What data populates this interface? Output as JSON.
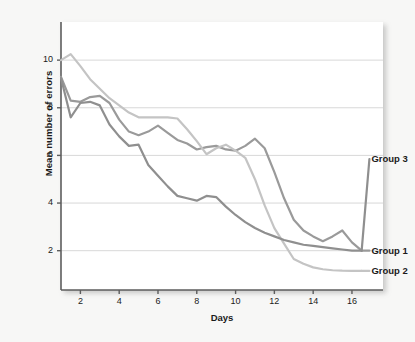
{
  "chart_data": {
    "type": "line",
    "title": "",
    "xlabel": "Days",
    "ylabel": "Mean number of errors",
    "xlim": [
      1,
      17.6
    ],
    "ylim": [
      0.35,
      11.6
    ],
    "grid": "horizontal",
    "legend_position": "right-inline",
    "xticks": [
      2,
      4,
      6,
      8,
      10,
      12,
      14,
      16
    ],
    "yticks": [
      2,
      4,
      6,
      8,
      10
    ],
    "x": [
      1,
      1.5,
      2,
      2.5,
      3,
      3.5,
      4,
      4.5,
      5,
      5.5,
      6,
      6.5,
      7,
      7.5,
      8,
      8.5,
      9,
      9.5,
      10,
      10.5,
      11,
      11.5,
      12,
      12.5,
      13,
      13.5,
      14,
      14.5,
      15,
      15.5,
      16,
      16.5
    ],
    "series": [
      {
        "name": "Group 1",
        "color": "#9a9a9a",
        "label": "Group 1",
        "values": [
          9.3,
          8.3,
          8.25,
          8.45,
          8.5,
          8.2,
          7.5,
          7.0,
          6.85,
          7.0,
          7.25,
          6.95,
          6.65,
          6.5,
          6.25,
          6.35,
          6.4,
          6.25,
          6.2,
          6.4,
          6.7,
          6.3,
          5.3,
          4.2,
          3.3,
          2.85,
          2.6,
          2.4,
          2.6,
          2.85,
          2.35,
          2.0
        ]
      },
      {
        "name": "Group 2",
        "color": "#c4c4c4",
        "label": "Group 2",
        "values": [
          10.0,
          10.25,
          9.75,
          9.2,
          8.8,
          8.4,
          8.1,
          7.8,
          7.6,
          7.6,
          7.6,
          7.6,
          7.55,
          7.1,
          6.6,
          6.05,
          6.3,
          6.45,
          6.2,
          5.9,
          5.0,
          3.9,
          2.95,
          2.3,
          1.65,
          1.45,
          1.3,
          1.22,
          1.18,
          1.16,
          1.15,
          1.15
        ]
      },
      {
        "name": "Group 3",
        "color": "#8f8f8f",
        "label": "Group 3",
        "values": [
          9.25,
          7.6,
          8.2,
          8.25,
          8.1,
          7.3,
          6.8,
          6.4,
          6.45,
          5.6,
          5.15,
          4.7,
          4.3,
          4.2,
          4.1,
          4.3,
          4.25,
          3.85,
          3.5,
          3.2,
          2.95,
          2.75,
          2.6,
          2.45,
          2.35,
          2.25,
          2.2,
          2.15,
          2.1,
          2.05,
          2.0,
          2.0
        ]
      }
    ],
    "annotations": [
      {
        "text": "Group 3",
        "anchor_x": 16.9,
        "anchor_y": 5.85
      },
      {
        "text": "Group 1",
        "anchor_x": 16.9,
        "anchor_y": 2.0
      },
      {
        "text": "Group 2",
        "anchor_x": 16.9,
        "anchor_y": 1.15
      }
    ]
  },
  "axes": {
    "x_label": "Days",
    "y_label": "Mean number of errors",
    "x_tick_labels": [
      "2",
      "4",
      "6",
      "8",
      "10",
      "12",
      "14",
      "16"
    ],
    "y_tick_labels": [
      "2",
      "4",
      "6",
      "8",
      "10"
    ]
  },
  "labels": {
    "group3": "Group 3",
    "group1": "Group 1",
    "group2": "Group 2"
  },
  "colors": {
    "canvas": "#ffffff",
    "page_background": "#f7f7f6",
    "gridline": "#d8d8d8",
    "axis": "#5d5d5d",
    "text": "#1b1b1b",
    "series_group1": "#9a9a9a",
    "series_group2": "#c4c4c4",
    "series_group3": "#8f8f8f"
  }
}
